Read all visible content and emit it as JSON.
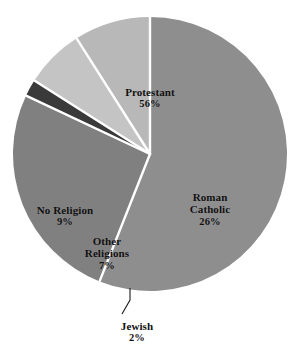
{
  "chart_data": {
    "type": "pie",
    "title": "",
    "subtitle": "",
    "xlabel": "",
    "ylabel": "",
    "legend_position": "none",
    "grid": false,
    "labels_on_slices": true,
    "unit": "%",
    "categories": [
      "Protestant",
      "Roman Catholic",
      "Jewish",
      "Other Religions",
      "No Religion"
    ],
    "values": [
      56,
      26,
      2,
      7,
      9
    ],
    "slices": [
      {
        "name": "Protestant",
        "value": 56,
        "label": "Protestant",
        "percent_label": "56%",
        "color": "#8e8e8e",
        "start_angle": 0,
        "end_angle": 201.6,
        "label_placement": "inside"
      },
      {
        "name": "Roman Catholic",
        "value": 26,
        "label": "Roman Catholic",
        "label_line_1": "Roman",
        "label_line_2": "Catholic",
        "percent_label": "26%",
        "color": "#808080",
        "start_angle": 201.6,
        "end_angle": 295.2,
        "label_placement": "inside"
      },
      {
        "name": "Jewish",
        "value": 2,
        "label": "Jewish",
        "percent_label": "2%",
        "color": "#3a3a3a",
        "start_angle": 295.2,
        "end_angle": 302.4,
        "label_placement": "outside-leader-line"
      },
      {
        "name": "Other Religions",
        "value": 7,
        "label": "Other Religions",
        "label_line_1": "Other",
        "label_line_2": "Religions",
        "percent_label": "7%",
        "color": "#c4c4c4",
        "start_angle": 302.4,
        "end_angle": 327.6,
        "label_placement": "inside"
      },
      {
        "name": "No Religion",
        "value": 9,
        "label": "No Religion",
        "percent_label": "9%",
        "color": "#b8b8b8",
        "start_angle": 327.6,
        "end_angle": 360,
        "label_placement": "inside"
      }
    ]
  },
  "colors": {
    "background": "#ffffff",
    "slice_separator": "#ffffff",
    "label_text": "#101010",
    "leader_line": "#1a1a1a",
    "protestant": "#8e8e8e",
    "roman_catholic": "#808080",
    "jewish": "#3a3a3a",
    "other_religions": "#c4c4c4",
    "no_religion": "#b8b8b8"
  },
  "labels": {
    "protestant": {
      "name": "Protestant",
      "percent": "56%"
    },
    "roman_catholic": {
      "line1": "Roman",
      "line2": "Catholic",
      "percent": "26%"
    },
    "no_religion": {
      "name": "No Religion",
      "percent": "9%"
    },
    "other_religions": {
      "line1": "Other",
      "line2": "Religions",
      "percent": "7%"
    },
    "jewish": {
      "name": "Jewish",
      "percent": "2%"
    }
  }
}
